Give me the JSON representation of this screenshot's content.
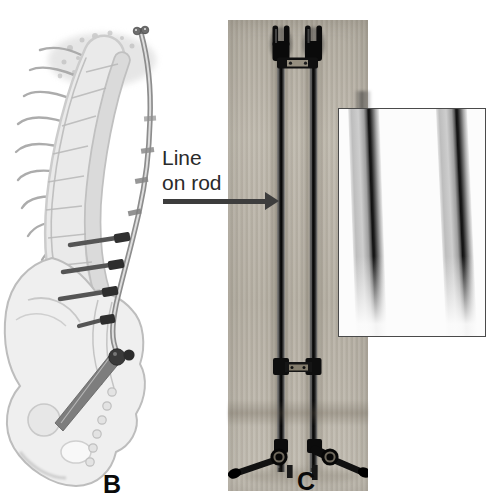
{
  "figure": {
    "annotation": {
      "lines": [
        "Line",
        "on rod"
      ],
      "arrow_icon": "right-arrow"
    },
    "panel_b": {
      "label": "B",
      "content": "spine-with-posterior-rod-illustration"
    },
    "panel_c": {
      "label": "C",
      "content": "dual-rod-construct-photograph"
    },
    "inset": {
      "content": "magnified-rods-showing-line-marking"
    },
    "colors": {
      "page_bg": "#ffffff",
      "panel_c_bg": "#bcb6aa",
      "inset_bg": "#fcfcfc",
      "inset_border": "#4a4a4a",
      "annotation_text": "#2a2a2a",
      "arrow": "#3d3d3d",
      "label": "#0a0a0a",
      "hardware_dark": "#141414",
      "illustration_gray": "#a8a8a8"
    }
  }
}
